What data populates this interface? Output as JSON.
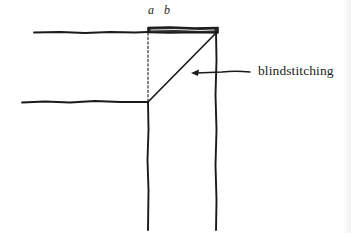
{
  "diagram": {
    "title": "",
    "labels": {
      "a": "a",
      "b": "b",
      "callout": "blindstitching"
    },
    "colors": {
      "ink": "#1a1a1a",
      "background": "#ffffff"
    },
    "elements": [
      {
        "name": "top-edge-line",
        "type": "line",
        "from": [
          34,
          32
        ],
        "to": [
          148,
          32
        ]
      },
      {
        "name": "folded-hem-band",
        "type": "band",
        "x": [
          148,
          218
        ],
        "y": [
          27,
          33
        ]
      },
      {
        "name": "fold-line-dashed",
        "type": "dashed-line",
        "from": [
          148,
          33
        ],
        "to": [
          148,
          102
        ]
      },
      {
        "name": "lower-edge-line",
        "type": "line",
        "from": [
          22,
          102
        ],
        "to": [
          148,
          102
        ]
      },
      {
        "name": "mitered-diagonal",
        "type": "line",
        "from": [
          148,
          102
        ],
        "to": [
          216,
          32
        ]
      },
      {
        "name": "inner-vertical-edge",
        "type": "line",
        "from": [
          148,
          102
        ],
        "to": [
          148,
          230
        ]
      },
      {
        "name": "outer-vertical-edge",
        "type": "line",
        "from": [
          216,
          32
        ],
        "to": [
          216,
          230
        ]
      },
      {
        "name": "callout-arrow",
        "type": "arrow",
        "from": [
          250,
          72
        ],
        "to": [
          192,
          72
        ]
      }
    ]
  }
}
